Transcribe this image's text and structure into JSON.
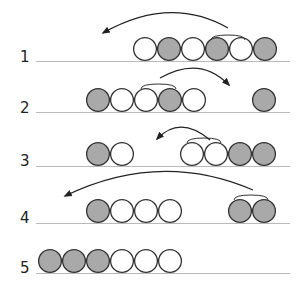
{
  "diagram": {
    "type": "ball-sorting-steps",
    "colors": {
      "gray": "#a9a9a9",
      "white": "#ffffff",
      "outline": "#333333",
      "baseline": "#b9b9b9",
      "arrow": "#222222"
    },
    "ball_diameter": 24,
    "rows": [
      {
        "label": "1",
        "label_y": 62,
        "line_y": 61,
        "balls": [
          {
            "x": 145,
            "color": "white"
          },
          {
            "x": 169,
            "color": "gray"
          },
          {
            "x": 193,
            "color": "white"
          },
          {
            "x": 217,
            "color": "gray"
          },
          {
            "x": 241,
            "color": "white"
          },
          {
            "x": 265,
            "color": "gray"
          }
        ],
        "bracket": {
          "x1": 211,
          "x2": 245,
          "y": 36
        },
        "arrow": {
          "from": [
            228,
            28
          ],
          "control": [
            170,
            -5
          ],
          "to": [
            103,
            33
          ],
          "direction": "left"
        }
      },
      {
        "label": "2",
        "label_y": 113,
        "line_y": 112,
        "balls": [
          {
            "x": 98,
            "color": "gray"
          },
          {
            "x": 122,
            "color": "white"
          },
          {
            "x": 146,
            "color": "white"
          },
          {
            "x": 170,
            "color": "gray"
          },
          {
            "x": 194,
            "color": "white"
          },
          {
            "x": 264,
            "color": "gray"
          }
        ],
        "bracket": {
          "x1": 141,
          "x2": 176,
          "y": 85
        },
        "arrow": {
          "from": [
            160,
            78
          ],
          "control": [
            200,
            55
          ],
          "to": [
            229,
            85
          ],
          "direction": "right"
        }
      },
      {
        "label": "3",
        "label_y": 166,
        "line_y": 166,
        "balls": [
          {
            "x": 98,
            "color": "gray"
          },
          {
            "x": 122,
            "color": "white"
          },
          {
            "x": 192,
            "color": "white"
          },
          {
            "x": 216,
            "color": "white"
          },
          {
            "x": 240,
            "color": "gray"
          },
          {
            "x": 264,
            "color": "gray"
          }
        ],
        "bracket": {
          "x1": 187,
          "x2": 221,
          "y": 139
        },
        "arrow": {
          "from": [
            210,
            140
          ],
          "control": [
            180,
            115
          ],
          "to": [
            157,
            139
          ],
          "direction": "left"
        }
      },
      {
        "label": "4",
        "label_y": 223,
        "line_y": 223,
        "balls": [
          {
            "x": 98,
            "color": "gray"
          },
          {
            "x": 122,
            "color": "white"
          },
          {
            "x": 146,
            "color": "white"
          },
          {
            "x": 170,
            "color": "white"
          },
          {
            "x": 240,
            "color": "gray"
          },
          {
            "x": 264,
            "color": "gray"
          }
        ],
        "bracket": {
          "x1": 234,
          "x2": 268,
          "y": 196
        },
        "arrow": {
          "from": [
            253,
            190
          ],
          "control": [
            160,
            150
          ],
          "to": [
            65,
            196
          ],
          "direction": "left"
        }
      },
      {
        "label": "5",
        "label_y": 273,
        "line_y": 273,
        "balls": [
          {
            "x": 50,
            "color": "gray"
          },
          {
            "x": 74,
            "color": "gray"
          },
          {
            "x": 98,
            "color": "gray"
          },
          {
            "x": 122,
            "color": "white"
          },
          {
            "x": 146,
            "color": "white"
          },
          {
            "x": 170,
            "color": "white"
          }
        ]
      }
    ],
    "line_x1": 36,
    "line_x2": 290,
    "label_x": 20
  }
}
